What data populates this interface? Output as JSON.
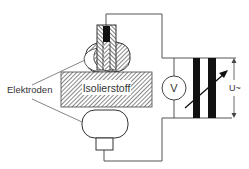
{
  "diagram": {
    "labels": {
      "electrodes": "Elektroden",
      "insulator": "Isolierstoff",
      "voltmeter": "V",
      "voltage": "U~"
    },
    "colors": {
      "line": "#555555",
      "dark": "#111111",
      "hatch": "#666666",
      "background": "#ffffff"
    }
  }
}
